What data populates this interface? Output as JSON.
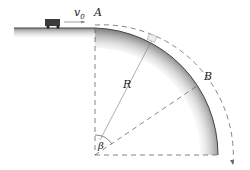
{
  "labels": {
    "velocity": "v",
    "velocity_sub": "0",
    "point_a": "A",
    "point_b": "B",
    "radius": "R",
    "angle": "β"
  },
  "colors": {
    "surface_shade": "#9a9a9a",
    "line": "#555555",
    "cart": "#3a3a3a"
  }
}
